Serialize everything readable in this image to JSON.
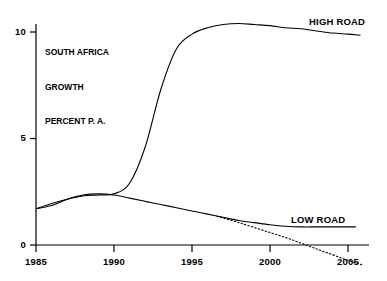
{
  "chart_data": {
    "type": "line",
    "title": "",
    "caption_lines": [
      "SOUTH AFRICA",
      "GROWTH",
      "PERCENT P. A."
    ],
    "xlabel": "",
    "ylabel": "",
    "xlim": [
      1985,
      2005
    ],
    "ylim": [
      0,
      10
    ],
    "grid": false,
    "legend_position": "inline-right",
    "xticks": [
      1985,
      1990,
      1995,
      2000,
      2005
    ],
    "xtick_labels": [
      "1985",
      "1990",
      "1995",
      "2000",
      "2005"
    ],
    "yticks": [
      0,
      5,
      10
    ],
    "ytick_labels": [
      "0",
      "5",
      "10"
    ],
    "series": [
      {
        "name": "HIGH ROAD",
        "style": "solid",
        "label": "HIGH ROAD",
        "x": [
          1985,
          1986,
          1987,
          1988,
          1989,
          1990,
          1991,
          1992,
          1993,
          1994,
          1995,
          1996,
          1997,
          1998,
          1999,
          2000,
          2001,
          2002,
          2003,
          2004,
          2005,
          2005.8
        ],
        "values": [
          1.7,
          1.95,
          2.15,
          2.3,
          2.35,
          2.4,
          2.9,
          4.6,
          7.3,
          9.2,
          9.9,
          10.2,
          10.35,
          10.4,
          10.35,
          10.3,
          10.2,
          10.15,
          10.05,
          9.95,
          9.9,
          9.85
        ]
      },
      {
        "name": "LOW ROAD",
        "style": "solid",
        "label": "LOW ROAD",
        "x": [
          1985,
          1986,
          1987,
          1988,
          1989,
          1990,
          1991,
          1992,
          1993,
          1994,
          1995,
          1996,
          1997,
          1998,
          1999,
          2000,
          2001,
          2002,
          2003,
          2004,
          2005,
          2005.5
        ],
        "values": [
          1.7,
          1.85,
          2.15,
          2.35,
          2.4,
          2.35,
          2.2,
          2.05,
          1.9,
          1.75,
          1.6,
          1.45,
          1.3,
          1.15,
          1.05,
          0.95,
          0.88,
          0.85,
          0.85,
          0.85,
          0.85,
          0.85
        ]
      },
      {
        "name": "LOW ROAD DOTTED EXTENSION",
        "style": "dotted",
        "label": "",
        "x": [
          1996.6,
          1998,
          1999.5,
          2001,
          2002.3,
          2003.5,
          2005,
          2006
        ],
        "values": [
          1.35,
          1.05,
          0.7,
          0.35,
          0.0,
          -0.32,
          -0.72,
          -0.95
        ]
      }
    ],
    "colors": {
      "line": "#000000",
      "axis": "#000000",
      "background": "#ffffff",
      "text": "#000000"
    }
  },
  "axes": {
    "y_axis_name": "y-axis",
    "x_axis_name": "x-axis"
  }
}
